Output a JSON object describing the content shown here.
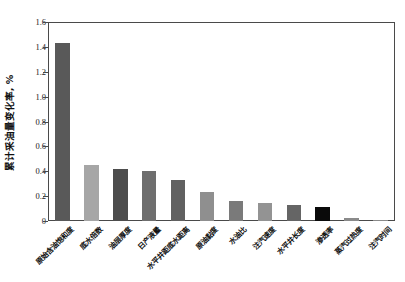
{
  "chart_data": {
    "type": "bar",
    "title": "",
    "subtitle": "",
    "xlabel": "",
    "ylabel": "累计采油量变化率, %",
    "ylim": [
      0,
      1.6
    ],
    "ytick_labels": [
      "0",
      "0.2",
      "0.4",
      "0.6",
      "0.8",
      "1.0",
      "1.2",
      "1.4",
      "1.6"
    ],
    "ytick_values": [
      0,
      0.2,
      0.4,
      0.6,
      0.8,
      1.0,
      1.2,
      1.4,
      1.6
    ],
    "grid": false,
    "legend": "none",
    "categories": [
      "原始含油饱和度",
      "底水倍数",
      "油层厚度",
      "日产液量",
      "水平井距底水距离",
      "原油黏度",
      "水油比",
      "注汽速度",
      "水平井长度",
      "渗透率",
      "蒸汽过热度",
      "注汽时间"
    ],
    "values": [
      1.435,
      0.45,
      0.415,
      0.402,
      0.33,
      0.232,
      0.16,
      0.146,
      0.125,
      0.11,
      0.022,
      0.012
    ],
    "bar_colors": [
      "#595959",
      "#a6a6a6",
      "#4d4d4d",
      "#6e6e6e",
      "#616161",
      "#8f8f8f",
      "#7a7a7a",
      "#939393",
      "#656565",
      "#0a0a0a",
      "#8a8a8a",
      "#8a8a8a"
    ],
    "axis_color": "#4a4a4a",
    "background_color": "#ffffff"
  }
}
